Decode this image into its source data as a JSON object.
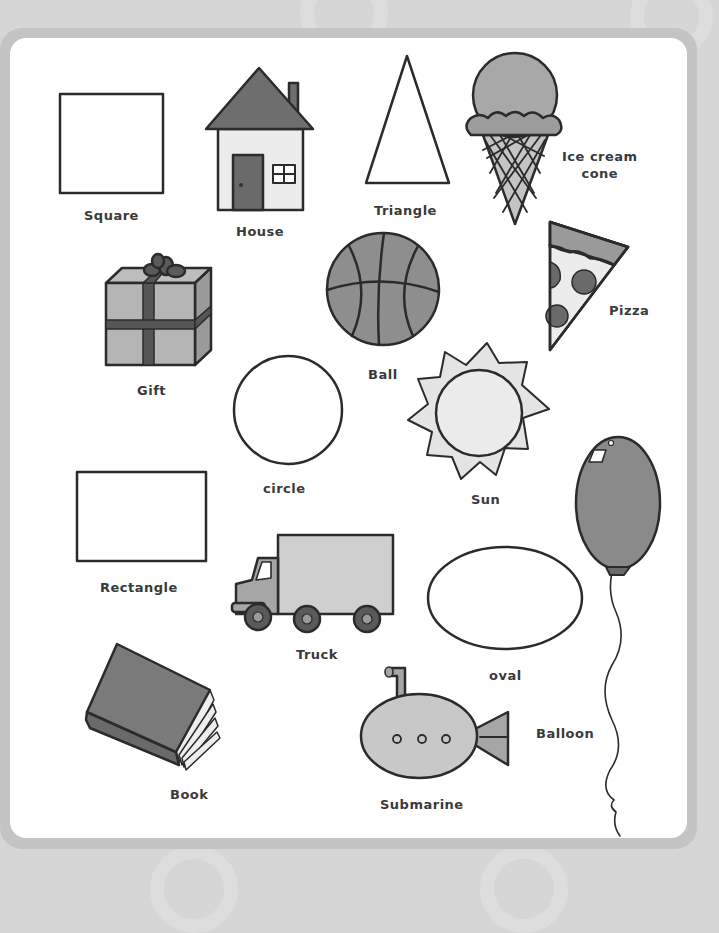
{
  "colors": {
    "background": "#d6d6d6",
    "frame": "#c4c4c4",
    "panel": "#ffffff",
    "outline": "#2b2b2b",
    "dark_fill": "#6e6e6e",
    "mid_fill": "#9a9a9a",
    "light_fill": "#c8c8c8",
    "pale_fill": "#e6e6e6"
  },
  "shapes": [
    {
      "id": "square",
      "label": "Square"
    },
    {
      "id": "house",
      "label": "House"
    },
    {
      "id": "triangle",
      "label": "Triangle"
    },
    {
      "id": "ice-cream-cone",
      "label": "Ice cream cone"
    },
    {
      "id": "gift",
      "label": "Gift"
    },
    {
      "id": "ball",
      "label": "Ball"
    },
    {
      "id": "pizza",
      "label": "Pizza"
    },
    {
      "id": "circle",
      "label": "circle"
    },
    {
      "id": "sun",
      "label": "Sun"
    },
    {
      "id": "rectangle",
      "label": "Rectangle"
    },
    {
      "id": "balloon",
      "label": "Balloon"
    },
    {
      "id": "truck",
      "label": "Truck"
    },
    {
      "id": "oval",
      "label": "oval"
    },
    {
      "id": "book",
      "label": "Book"
    },
    {
      "id": "submarine",
      "label": "Submarine"
    }
  ],
  "labels": {
    "square": "Square",
    "house": "House",
    "triangle": "Triangle",
    "ice_cream_line1": "Ice cream",
    "ice_cream_line2": "cone",
    "gift": "Gift",
    "ball": "Ball",
    "pizza": "Pizza",
    "circle": "circle",
    "sun": "Sun",
    "rectangle": "Rectangle",
    "truck": "Truck",
    "oval": "oval",
    "balloon": "Balloon",
    "book": "Book",
    "submarine": "Submarine"
  }
}
